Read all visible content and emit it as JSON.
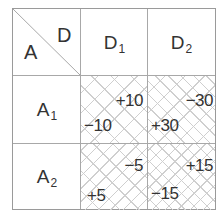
{
  "corner": {
    "top_right": "D",
    "bottom_left": "A"
  },
  "columns": [
    {
      "base": "D",
      "sub": "1"
    },
    {
      "base": "D",
      "sub": "2"
    }
  ],
  "rows": [
    {
      "base": "A",
      "sub": "1",
      "cells": [
        {
          "upper": "+10",
          "lower": "−10"
        },
        {
          "upper": "−30",
          "lower": "+30"
        }
      ]
    },
    {
      "base": "A",
      "sub": "2",
      "cells": [
        {
          "upper": "−5",
          "lower": "+5"
        },
        {
          "upper": "+15",
          "lower": "−15"
        }
      ]
    }
  ],
  "colors": {
    "grid": "#a8a8a8",
    "hatch": "#cfcfcf",
    "text": "#333333"
  }
}
